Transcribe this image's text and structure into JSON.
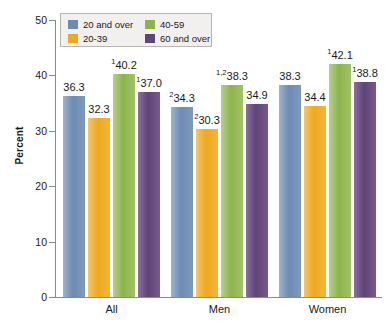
{
  "chart_data": {
    "type": "bar",
    "title": "",
    "xlabel": "",
    "ylabel": "Percent",
    "ylim": [
      0,
      50
    ],
    "yticks": [
      0,
      10,
      20,
      30,
      40,
      50
    ],
    "grid": false,
    "legend_position": "top-left",
    "categories": [
      "All",
      "Men",
      "Women"
    ],
    "series": [
      {
        "name": "20 and over",
        "color": "#6d8cb4",
        "values": [
          36.3,
          34.3,
          38.3
        ],
        "labels": [
          "36.3",
          "34.3",
          "38.3"
        ],
        "footnotes": [
          "",
          "2",
          ""
        ]
      },
      {
        "name": "20-39",
        "color": "#efa820",
        "values": [
          32.3,
          30.3,
          34.4
        ],
        "labels": [
          "32.3",
          "30.3",
          "34.4"
        ],
        "footnotes": [
          "",
          "2",
          ""
        ]
      },
      {
        "name": "40-59",
        "color": "#8cb44b",
        "values": [
          40.2,
          38.3,
          42.1
        ],
        "labels": [
          "40.2",
          "38.3",
          "42.1"
        ],
        "footnotes": [
          "1",
          "1,2",
          "1"
        ]
      },
      {
        "name": "60 and over",
        "color": "#5f4476",
        "values": [
          37.0,
          34.9,
          38.8
        ],
        "labels": [
          "37.0",
          "34.9",
          "38.8"
        ],
        "footnotes": [
          "1",
          "",
          "1"
        ]
      }
    ]
  },
  "axis": {
    "y_title": "Percent",
    "y_tick_labels": [
      "0",
      "10",
      "20",
      "30",
      "40",
      "50"
    ],
    "x_tick_labels": [
      "All",
      "Men",
      "Women"
    ]
  },
  "legend": {
    "items": [
      {
        "label": "20 and over",
        "color": "#6d8cb4"
      },
      {
        "label": "20-39",
        "color": "#efa820"
      },
      {
        "label": "40-59",
        "color": "#8cb44b"
      },
      {
        "label": "60 and over",
        "color": "#5f4476"
      }
    ]
  }
}
